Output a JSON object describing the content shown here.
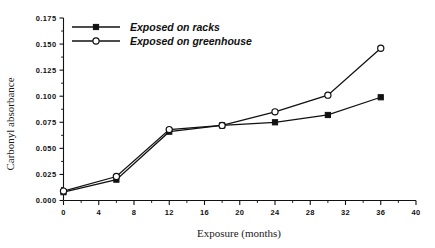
{
  "chart_data": {
    "type": "line",
    "title": "",
    "xlabel": "Exposure (months)",
    "ylabel": "Carbonyl absorbance",
    "x": [
      0,
      6,
      12,
      18,
      24,
      30,
      36
    ],
    "xlim": [
      0,
      40
    ],
    "ylim": [
      0.0,
      0.175
    ],
    "xticks": [
      0,
      4,
      8,
      12,
      16,
      20,
      24,
      28,
      32,
      36,
      40
    ],
    "xtick_labels": [
      "0",
      "4",
      "8",
      "12",
      "16",
      "20",
      "24",
      "28",
      "32",
      "36",
      "40"
    ],
    "yticks": [
      0.0,
      0.025,
      0.05,
      0.075,
      0.1,
      0.125,
      0.15,
      0.175
    ],
    "ytick_labels": [
      "0.000",
      "0.025",
      "0.050",
      "0.075",
      "0.100",
      "0.125",
      "0.150",
      "0.175"
    ],
    "grid": false,
    "legend_position": "top-left",
    "series": [
      {
        "name": "Exposed on racks",
        "marker": "filled-square",
        "values": [
          0.008,
          0.02,
          0.066,
          0.072,
          0.075,
          0.082,
          0.099
        ]
      },
      {
        "name": "Exposed on greenhouse",
        "marker": "open-circle",
        "values": [
          0.009,
          0.023,
          0.068,
          0.072,
          0.085,
          0.101,
          0.146
        ]
      }
    ]
  },
  "legend": {
    "entries": [
      {
        "label": "Exposed on racks",
        "marker": "filled-square-marker"
      },
      {
        "label": "Exposed on greenhouse",
        "marker": "open-circle-marker"
      }
    ]
  },
  "axes": {
    "x_title": "Exposure (months)",
    "y_title": "Carbonyl absorbance"
  }
}
